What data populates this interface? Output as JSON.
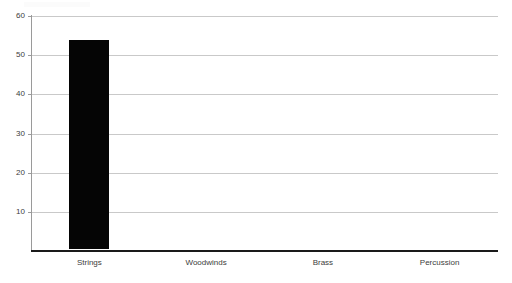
{
  "chart_data": {
    "type": "bar",
    "title": "",
    "subtitle": "",
    "xlabel": "",
    "ylabel": "",
    "categories": [
      "Strings",
      "Woodwinds",
      "Brass",
      "Percussion"
    ],
    "values": [
      53.3,
      0,
      0,
      0
    ],
    "series": [
      {
        "name": "",
        "values": [
          53.3,
          0,
          0,
          0
        ]
      }
    ],
    "ylim": [
      0,
      60
    ],
    "yticks": [
      10,
      20,
      30,
      40,
      50,
      60
    ],
    "ytick_labels": [
      "10",
      "20",
      "30",
      "40",
      "50",
      "60"
    ],
    "grid": "horizontal",
    "legend": "none",
    "bar_color": "#050505",
    "gridline_color": "#c9c9c9",
    "axis_color": "#1a1a1a",
    "label_color": "#3c3c3c",
    "background_color": "#ffffff",
    "annotations": []
  },
  "axes": {
    "y_ticks": [
      {
        "label": "60",
        "value": 60
      },
      {
        "label": "50",
        "value": 50
      },
      {
        "label": "40",
        "value": 40
      },
      {
        "label": "30",
        "value": 30
      },
      {
        "label": "20",
        "value": 20
      },
      {
        "label": "10",
        "value": 10
      }
    ],
    "x_categories": [
      {
        "label": "Strings",
        "value": 53.3
      },
      {
        "label": "Woodwinds",
        "value": 0
      },
      {
        "label": "Brass",
        "value": 0
      },
      {
        "label": "Percussion",
        "value": 0
      }
    ]
  }
}
